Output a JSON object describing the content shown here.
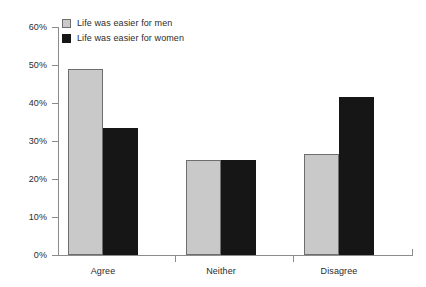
{
  "chart_data": {
    "type": "bar",
    "title": "",
    "xlabel": "",
    "ylabel": "",
    "categories": [
      "Agree",
      "Neither",
      "Disagree"
    ],
    "series": [
      {
        "name": "Life was easier for men",
        "color": "#c9c9c9",
        "values": [
          49,
          25,
          26.5
        ]
      },
      {
        "name": "Life was easier for women",
        "color": "#161616",
        "values": [
          33.5,
          25,
          41.5
        ]
      }
    ],
    "ylim": [
      0,
      60
    ],
    "ytick_labels": [
      "0%",
      "10%",
      "20%",
      "30%",
      "40%",
      "50%",
      "60%"
    ],
    "ytick_values": [
      0,
      10,
      20,
      30,
      40,
      50,
      60
    ],
    "grid": false,
    "legend_position": "top-left"
  },
  "legend": {
    "items": [
      {
        "label": "Life was easier for men",
        "swatch": "legend-swatch-men"
      },
      {
        "label": "Life was easier for women",
        "swatch": "legend-swatch-women"
      }
    ]
  },
  "axes": {
    "y": {
      "labels": [
        "60%",
        "50%",
        "40%",
        "30%",
        "20%",
        "10%",
        "0%"
      ]
    },
    "x": {
      "labels": [
        "Agree",
        "Neither",
        "Disagree"
      ]
    }
  }
}
